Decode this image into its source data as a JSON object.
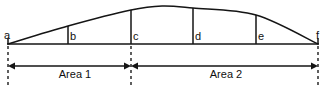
{
  "figure": {
    "background_color": "#ffffff",
    "line_color": "#151515",
    "baseline_y": 44,
    "width": 326,
    "height": 90
  },
  "points": [
    {
      "label": "a",
      "x": 8,
      "curve_y": 44,
      "label_x": 4,
      "label_y": 30
    },
    {
      "label": "b",
      "x": 68,
      "curve_y": 26,
      "label_x": 70,
      "label_y": 31
    },
    {
      "label": "c",
      "x": 131,
      "curve_y": 10,
      "label_x": 133,
      "label_y": 31
    },
    {
      "label": "d",
      "x": 193,
      "curve_y": 8,
      "label_x": 195,
      "label_y": 31
    },
    {
      "label": "e",
      "x": 256,
      "curve_y": 15,
      "label_x": 258,
      "label_y": 31
    },
    {
      "label": "f",
      "x": 318,
      "curve_y": 44,
      "label_x": 316,
      "label_y": 30
    }
  ],
  "curve": {
    "description": "smooth arch rising from a, peaking between c and d, descending to f",
    "peak_x": 162,
    "peak_y": 6
  },
  "dimensions": [
    {
      "label": "Area 1",
      "from_point": "a",
      "to_point": "c",
      "x_start": 8,
      "x_end": 131,
      "arrow_y": 66,
      "label_center_x": 75,
      "label_y": 68
    },
    {
      "label": "Area 2",
      "from_point": "c",
      "to_point": "f",
      "x_start": 131,
      "x_end": 318,
      "arrow_y": 66,
      "label_center_x": 226,
      "label_y": 68
    }
  ],
  "extension_lines": [
    {
      "name": "extension-a",
      "x": 8,
      "y_top": 46,
      "y_bottom": 85
    },
    {
      "name": "extension-c",
      "x": 131,
      "y_top": 46,
      "y_bottom": 85
    },
    {
      "name": "extension-f",
      "x": 318,
      "y_top": 46,
      "y_bottom": 85
    }
  ]
}
